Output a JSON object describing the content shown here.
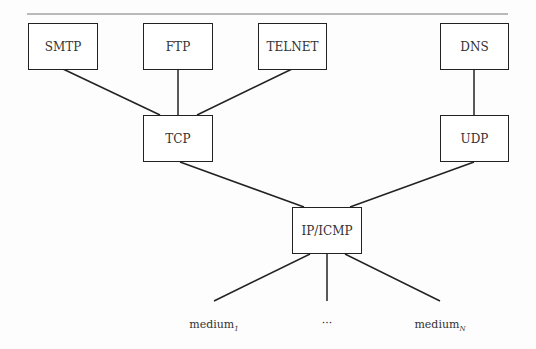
{
  "diagram": {
    "title_rule": true,
    "nodes": {
      "smtp": {
        "label": "SMTP",
        "layer": "application"
      },
      "ftp": {
        "label": "FTP",
        "layer": "application"
      },
      "telnet": {
        "label": "TELNET",
        "layer": "application"
      },
      "dns": {
        "label": "DNS",
        "layer": "application"
      },
      "tcp": {
        "label": "TCP",
        "layer": "transport"
      },
      "udp": {
        "label": "UDP",
        "layer": "transport"
      },
      "ip": {
        "label": "IP/ICMP",
        "layer": "network"
      }
    },
    "edges": [
      [
        "SMTP",
        "TCP"
      ],
      [
        "FTP",
        "TCP"
      ],
      [
        "TELNET",
        "TCP"
      ],
      [
        "DNS",
        "UDP"
      ],
      [
        "TCP",
        "IP/ICMP"
      ],
      [
        "UDP",
        "IP/ICMP"
      ],
      [
        "IP/ICMP",
        "medium_1"
      ],
      [
        "IP/ICMP",
        "..."
      ],
      [
        "IP/ICMP",
        "medium_N"
      ]
    ],
    "media": {
      "first": {
        "base": "medium",
        "sub": "1"
      },
      "ellipsis": "···",
      "last": {
        "base": "medium",
        "sub": "N"
      }
    }
  }
}
